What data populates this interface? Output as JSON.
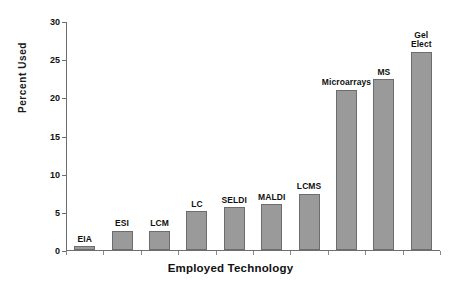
{
  "chart_data": {
    "type": "bar",
    "title": "",
    "xlabel": "Employed Technology",
    "ylabel": "Percent Used",
    "ylim": [
      0,
      30
    ],
    "yticks": [
      0,
      5,
      10,
      15,
      20,
      25,
      30
    ],
    "ytick_labels": [
      "0",
      "5",
      "10",
      "15",
      "20",
      "25",
      "30"
    ],
    "grid": false,
    "legend": "none",
    "categories": [
      "EIA",
      "ESI",
      "LCM",
      "LC",
      "SELDI",
      "MALDI",
      "LCMS",
      "Microarrays",
      "MS",
      "Gel Elect"
    ],
    "values": [
      0.5,
      2.5,
      2.5,
      5.1,
      5.6,
      6.0,
      7.4,
      21.0,
      22.4,
      26.0
    ],
    "series": [
      {
        "name": "Percent Used",
        "values": [
          0.5,
          2.5,
          2.5,
          5.1,
          5.6,
          6.0,
          7.4,
          21.0,
          22.4,
          26.0
        ],
        "color": "#9a9a9a"
      }
    ],
    "bar_labels": [
      "EIA",
      "ESI",
      "LCM",
      "LC",
      "SELDI",
      "MALDI",
      "LCMS",
      "Microarrays",
      "MS",
      "Gel\nElect"
    ],
    "colors": {
      "bar_fill": "#9a9a9a",
      "bar_edge": "#6d6d6d",
      "axis": "#6e6e6e",
      "text": "#111111",
      "background": "#ffffff"
    }
  }
}
